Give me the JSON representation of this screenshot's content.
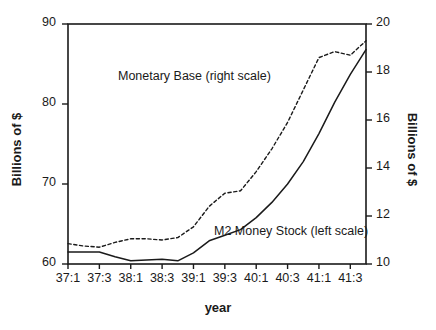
{
  "figure": {
    "background": "#ffffff",
    "line_color": "#1a1a1a"
  },
  "chart_data": {
    "type": "line",
    "title": "",
    "xlabel": "year",
    "ylabel": "Billions of $",
    "ylabel_right": "Billions of $",
    "grid": false,
    "legend_position": "inline-annotations",
    "x": [
      "37:1",
      "37:2",
      "37:3",
      "37:4",
      "38:1",
      "38:2",
      "38:3",
      "38:4",
      "39:1",
      "39:2",
      "39:3",
      "39:4",
      "40:1",
      "40:2",
      "40:3",
      "40:4",
      "41:1",
      "41:2",
      "41:3",
      "41:4"
    ],
    "xtick_labels": [
      "37:1",
      "37:3",
      "38:1",
      "38:3",
      "39:1",
      "39:3",
      "40:1",
      "40:3",
      "41:1",
      "41:3"
    ],
    "xlim": [
      "37:1",
      "41:4"
    ],
    "ylim": [
      60,
      90
    ],
    "ytick_labels": [
      "60",
      "70",
      "80",
      "90"
    ],
    "ytick_values": [
      60,
      70,
      80,
      90
    ],
    "ylim_right": [
      10,
      20
    ],
    "ytick_labels_right": [
      "10",
      "12",
      "14",
      "16",
      "18",
      "20"
    ],
    "ytick_values_right": [
      10,
      12,
      14,
      16,
      18,
      20
    ],
    "series": [
      {
        "name": "M2 Money Stock (left scale)",
        "axis": "left",
        "style": "solid",
        "annotation": "M2 Money Stock (left scale)",
        "values": [
          61.5,
          61.5,
          61.5,
          60.9,
          60.4,
          60.5,
          60.6,
          60.4,
          61.4,
          62.9,
          63.6,
          64.3,
          65.8,
          67.7,
          70.0,
          72.8,
          76.3,
          80.2,
          83.7,
          86.8
        ]
      },
      {
        "name": "Monetary Base (right scale)",
        "axis": "right",
        "style": "dashed",
        "annotation": "Monetary Base (right scale)",
        "values": [
          10.85,
          10.75,
          10.7,
          10.9,
          11.05,
          11.05,
          11.0,
          11.1,
          11.55,
          12.4,
          12.95,
          13.05,
          13.85,
          14.8,
          15.9,
          17.25,
          18.6,
          18.85,
          18.7,
          19.3
        ]
      }
    ],
    "annotations": [
      {
        "text": "Monetary Base (right scale)",
        "x_px": 118,
        "y_px": 69
      },
      {
        "text": "M2 Money Stock (left scale)",
        "x_px": 214,
        "y_px": 224
      }
    ]
  }
}
